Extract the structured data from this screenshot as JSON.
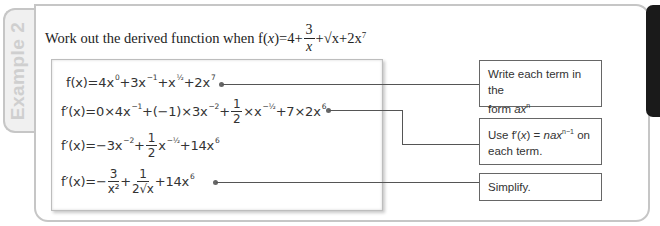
{
  "example_tab": {
    "label": "Example 2"
  },
  "question": {
    "text": "Work out the derived function when f(",
    "var": "x",
    "after_var": ")=4+",
    "frac_num": "3",
    "frac_den": "x",
    "rest": "+√x+2x",
    "exp": "7"
  },
  "equations": [
    {
      "id": "line1",
      "lhs": "f(x)=",
      "parts": [
        "4x",
        "0",
        "+3x",
        "−1",
        "+x",
        "½",
        "+2x",
        "7"
      ]
    },
    {
      "id": "line2",
      "lhs": "f′(x)=",
      "text_a": "0×4x",
      "sup_a": "−1",
      "text_b": "+(−1)×3x",
      "sup_b": "−2",
      "text_c": "+",
      "frac_n": "1",
      "frac_d": "2",
      "text_d": "×x",
      "sup_d": "−½",
      "text_e": "+7×2x",
      "sup_e": "6"
    },
    {
      "id": "line3",
      "lhs": "f′(x)=",
      "text_a": "−3x",
      "sup_a": "−2",
      "text_b": "+",
      "frac_n": "1",
      "frac_d": "2",
      "text_c": "x",
      "sup_c": "−½",
      "text_d": "+14x",
      "sup_d": "6"
    },
    {
      "id": "line4",
      "lhs": "f′(x)=−",
      "frac1_n": "3",
      "frac1_d": "x²",
      "plus": "+",
      "frac2_n": "1",
      "frac2_d": "2√x",
      "text_c": "+14x",
      "sup_c": "6"
    }
  ],
  "notes": [
    {
      "line1": "Write each term in the",
      "line2_pre": "form ",
      "line2_it": "ax",
      "line2_sup": "n"
    },
    {
      "pre": "Use f′(",
      "it1": "x",
      "mid": ") = ",
      "it2": "nax",
      "sup": "n−1",
      "post": " on",
      "line2": "each term."
    },
    {
      "text": "Simplify."
    }
  ],
  "colors": {
    "frame": "#c6c6c6",
    "tab_bg": "#f0f0f0",
    "tab_text": "#cfcfcf",
    "text": "#222222",
    "connector": "#555555",
    "dark_tab": "#1a1a1a"
  }
}
